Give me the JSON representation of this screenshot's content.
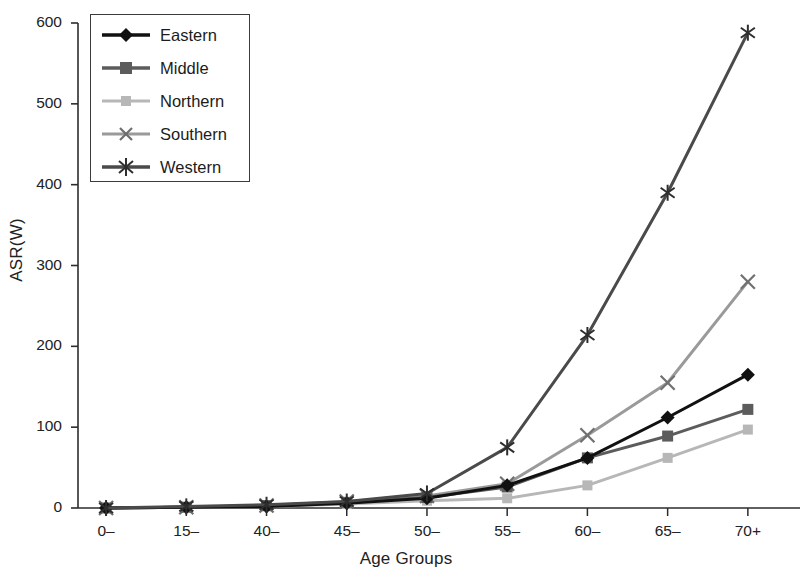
{
  "chart_data": {
    "type": "line",
    "title": "",
    "xlabel": "Age Groups",
    "ylabel": "ASR(W)",
    "categories": [
      "0–",
      "15–",
      "40–",
      "45–",
      "50–",
      "55–",
      "60–",
      "65–",
      "70+"
    ],
    "ylim": [
      0,
      600
    ],
    "yticks": [
      0,
      100,
      200,
      300,
      400,
      500,
      600
    ],
    "ytick_labels": [
      "0",
      "100",
      "200",
      "300",
      "400",
      "500",
      "600"
    ],
    "grid": false,
    "legend_position": "upper-left-inside",
    "series": [
      {
        "name": "Eastern",
        "color": "#111111",
        "marker": "diamond",
        "values": [
          0,
          1,
          2,
          6,
          12,
          28,
          62,
          112,
          165
        ]
      },
      {
        "name": "Middle",
        "color": "#5c5c5c",
        "marker": "square",
        "values": [
          0,
          1,
          3,
          7,
          13,
          26,
          62,
          89,
          122
        ]
      },
      {
        "name": "Northern",
        "color": "#b7b7b7",
        "marker": "square-small",
        "values": [
          0,
          1,
          2,
          5,
          9,
          12,
          28,
          62,
          97
        ]
      },
      {
        "name": "Southern",
        "color": "#9a9a9a",
        "marker": "x",
        "values": [
          0,
          1,
          3,
          8,
          15,
          30,
          90,
          155,
          280
        ]
      },
      {
        "name": "Western",
        "color": "#4a4a4a",
        "marker": "asterisk",
        "values": [
          0,
          2,
          4,
          8,
          18,
          75,
          214,
          390,
          588
        ]
      }
    ]
  },
  "axes": {
    "ylabel": "ASR(W)",
    "xlabel": "Age Groups"
  },
  "legend": {
    "items": [
      {
        "label": "Eastern"
      },
      {
        "label": "Middle"
      },
      {
        "label": "Northern"
      },
      {
        "label": "Southern"
      },
      {
        "label": "Western"
      }
    ]
  }
}
